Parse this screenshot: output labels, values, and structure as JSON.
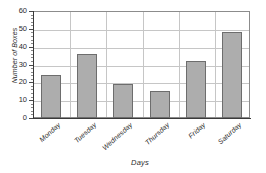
{
  "figure": {
    "partial_title_fragment": "",
    "background_color": "#ffffff",
    "bar_fill_color": "#adadad",
    "bar_edge_color": "#6d6d6d",
    "grid_color": "#c6c6c6",
    "axis_color": "#3a3a3a"
  },
  "chart_data": {
    "type": "bar",
    "title": "",
    "xlabel": "Days",
    "ylabel": "Number of Boxes",
    "categories": [
      "Monday",
      "Tuesday",
      "Wednesday",
      "Thursday",
      "Friday",
      "Saturday"
    ],
    "values": [
      24,
      36,
      19,
      15,
      32,
      48
    ],
    "ylim": [
      0,
      60
    ],
    "ytick_labels": [
      "0",
      "10",
      "20",
      "30",
      "40",
      "50",
      "60"
    ],
    "ytick_values": [
      0,
      10,
      20,
      30,
      40,
      50,
      60
    ],
    "y_minor_tick_step": 2,
    "grid": "both",
    "legend": "none",
    "xtick_label_rotation_degrees": 42,
    "orientation": "vertical"
  }
}
